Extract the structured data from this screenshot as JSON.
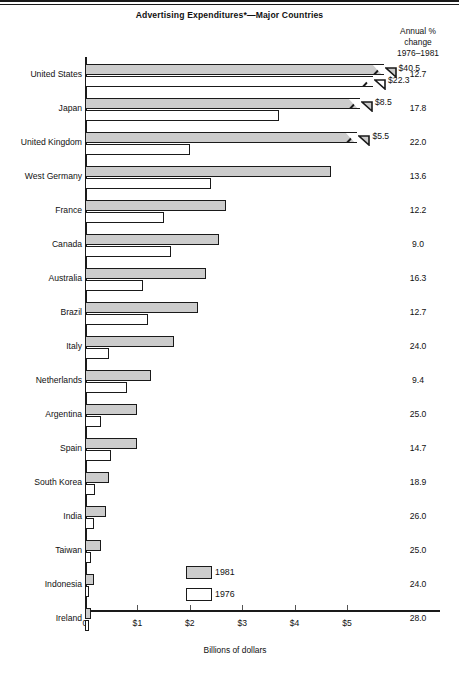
{
  "header": {
    "title": "Advertising Expenditures*—Major Countries",
    "pct_header_line1": "Annual %",
    "pct_header_line2": "change",
    "pct_header_line3": "1976–1981"
  },
  "axis": {
    "caption": "Billions of dollars",
    "ticks": [
      "0",
      "$1",
      "$2",
      "$3",
      "$4",
      "$5"
    ]
  },
  "legend": {
    "items": [
      {
        "label": "1981",
        "swatch": "gray-filled-swatch"
      },
      {
        "label": "1976",
        "swatch": "white-open-swatch"
      }
    ]
  },
  "chart_data": {
    "type": "bar",
    "title": "Advertising Expenditures*—Major Countries",
    "xlabel": "Billions of dollars",
    "ylabel": "",
    "orientation": "horizontal",
    "xlim": [
      0,
      5.6
    ],
    "xticks": [
      0,
      1,
      2,
      3,
      4,
      5
    ],
    "xtick_labels": [
      "0",
      "$1",
      "$2",
      "$3",
      "$4",
      "$5"
    ],
    "grid": false,
    "legend_position": "inside-bottom-center",
    "note": "Bars for United States, Japan and United Kingdom are broken (axis truncated); their true values are printed at the bar ends.",
    "categories": [
      "United States",
      "Japan",
      "United Kingdom",
      "West Germany",
      "France",
      "Canada",
      "Australia",
      "Brazil",
      "Italy",
      "Netherlands",
      "Argentina",
      "Spain",
      "South Korea",
      "India",
      "Taiwan",
      "Indonesia",
      "Ireland"
    ],
    "series": [
      {
        "name": "1981",
        "values": [
          40.5,
          8.5,
          5.5,
          4.7,
          2.7,
          2.55,
          2.3,
          2.15,
          1.7,
          1.25,
          1.0,
          1.0,
          0.45,
          0.4,
          0.3,
          0.17,
          0.12
        ]
      },
      {
        "name": "1976",
        "values": [
          22.3,
          3.7,
          2.0,
          2.4,
          1.5,
          1.65,
          1.1,
          1.2,
          0.45,
          0.8,
          0.3,
          0.5,
          0.2,
          0.17,
          0.12,
          0.07,
          0.05
        ]
      }
    ],
    "annual_pct_change_1976_1981": [
      12.7,
      17.8,
      22.0,
      13.6,
      12.2,
      9.0,
      16.3,
      12.7,
      24.0,
      9.4,
      25.0,
      14.7,
      18.9,
      26.0,
      25.0,
      24.0,
      28.0
    ],
    "value_labels": {
      "United States": {
        "1981": "$40.5",
        "1976": "$22.3"
      },
      "Japan": {
        "1981": "$8.5"
      },
      "United Kingdom": {
        "1981": "$5.5"
      }
    }
  },
  "rows": [
    {
      "label": "United States",
      "pct": "12.7",
      "v1981": 40.5,
      "v1976": 22.3,
      "b1981": 5.45,
      "b1976": 5.25,
      "broken1981": true,
      "broken1976": true,
      "lab1981": "$40.5",
      "lab1976": "$22.3"
    },
    {
      "label": "Japan",
      "pct": "17.8",
      "v1981": 8.5,
      "v1976": 3.7,
      "b1981": 5.0,
      "b1976": 3.7,
      "broken1981": true,
      "broken1976": false,
      "lab1981": "$8.5",
      "lab1976": ""
    },
    {
      "label": "United Kingdom",
      "pct": "22.0",
      "v1981": 5.5,
      "v1976": 2.0,
      "b1981": 4.95,
      "b1976": 2.0,
      "broken1981": true,
      "broken1976": false,
      "lab1981": "$5.5",
      "lab1976": ""
    },
    {
      "label": "West Germany",
      "pct": "13.6",
      "v1981": 4.7,
      "v1976": 2.4,
      "b1981": 4.7,
      "b1976": 2.4,
      "broken1981": false,
      "broken1976": false,
      "lab1981": "",
      "lab1976": ""
    },
    {
      "label": "France",
      "pct": "12.2",
      "v1981": 2.7,
      "v1976": 1.5,
      "b1981": 2.7,
      "b1976": 1.5,
      "broken1981": false,
      "broken1976": false,
      "lab1981": "",
      "lab1976": ""
    },
    {
      "label": "Canada",
      "pct": "9.0",
      "v1981": 2.55,
      "v1976": 1.65,
      "b1981": 2.55,
      "b1976": 1.65,
      "broken1981": false,
      "broken1976": false,
      "lab1981": "",
      "lab1976": ""
    },
    {
      "label": "Australia",
      "pct": "16.3",
      "v1981": 2.3,
      "v1976": 1.1,
      "b1981": 2.3,
      "b1976": 1.1,
      "broken1981": false,
      "broken1976": false,
      "lab1981": "",
      "lab1976": ""
    },
    {
      "label": "Brazil",
      "pct": "12.7",
      "v1981": 2.15,
      "v1976": 1.2,
      "b1981": 2.15,
      "b1976": 1.2,
      "broken1981": false,
      "broken1976": false,
      "lab1981": "",
      "lab1976": ""
    },
    {
      "label": "Italy",
      "pct": "24.0",
      "v1981": 1.7,
      "v1976": 0.45,
      "b1981": 1.7,
      "b1976": 0.45,
      "broken1981": false,
      "broken1976": false,
      "lab1981": "",
      "lab1976": ""
    },
    {
      "label": "Netherlands",
      "pct": "9.4",
      "v1981": 1.25,
      "v1976": 0.8,
      "b1981": 1.25,
      "b1976": 0.8,
      "broken1981": false,
      "broken1976": false,
      "lab1981": "",
      "lab1976": ""
    },
    {
      "label": "Argentina",
      "pct": "25.0",
      "v1981": 1.0,
      "v1976": 0.3,
      "b1981": 1.0,
      "b1976": 0.3,
      "broken1981": false,
      "broken1976": false,
      "lab1981": "",
      "lab1976": ""
    },
    {
      "label": "Spain",
      "pct": "14.7",
      "v1981": 1.0,
      "v1976": 0.5,
      "b1981": 1.0,
      "b1976": 0.5,
      "broken1981": false,
      "broken1976": false,
      "lab1981": "",
      "lab1976": ""
    },
    {
      "label": "South Korea",
      "pct": "18.9",
      "v1981": 0.45,
      "v1976": 0.2,
      "b1981": 0.45,
      "b1976": 0.2,
      "broken1981": false,
      "broken1976": false,
      "lab1981": "",
      "lab1976": ""
    },
    {
      "label": "India",
      "pct": "26.0",
      "v1981": 0.4,
      "v1976": 0.17,
      "b1981": 0.4,
      "b1976": 0.17,
      "broken1981": false,
      "broken1976": false,
      "lab1981": "",
      "lab1976": ""
    },
    {
      "label": "Taiwan",
      "pct": "25.0",
      "v1981": 0.3,
      "v1976": 0.12,
      "b1981": 0.3,
      "b1976": 0.12,
      "broken1981": false,
      "broken1976": false,
      "lab1981": "",
      "lab1976": ""
    },
    {
      "label": "Indonesia",
      "pct": "24.0",
      "v1981": 0.17,
      "v1976": 0.07,
      "b1981": 0.17,
      "b1976": 0.07,
      "broken1981": false,
      "broken1976": false,
      "lab1981": "",
      "lab1976": ""
    },
    {
      "label": "Ireland",
      "pct": "28.0",
      "v1981": 0.12,
      "v1976": 0.05,
      "b1981": 0.12,
      "b1976": 0.05,
      "broken1981": false,
      "broken1976": false,
      "lab1981": "",
      "lab1976": ""
    }
  ]
}
